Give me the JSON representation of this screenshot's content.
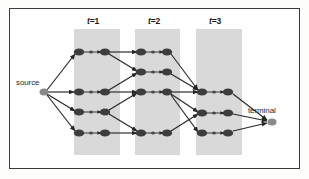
{
  "figure": {
    "type": "trellis-diagram",
    "title": "",
    "background_color": "#fefefe",
    "frame_color": "#3a3a3a",
    "band_color": "#cccccc",
    "node_color": "#3d3d3d",
    "small_node_color": "#4a4a4a",
    "edge_color": "#262626",
    "source_node_color": "#8a8a8a",
    "terminal_node_color": "#8a8a8a"
  },
  "labels": {
    "source": "source",
    "terminal": "terminal",
    "stages": [
      {
        "id": "t1",
        "var": "t",
        "eq": "=1",
        "text": "t=1"
      },
      {
        "id": "t2",
        "var": "t",
        "eq": "=2",
        "text": "t=2"
      },
      {
        "id": "t3",
        "var": "t",
        "eq": "=3",
        "text": "t=3"
      }
    ]
  },
  "bands": [
    {
      "id": "band-t1",
      "x": 74,
      "y": 29,
      "width": 46,
      "height": 126
    },
    {
      "id": "band-t2",
      "x": 135,
      "y": 29,
      "width": 45,
      "height": 126
    },
    {
      "id": "band-t3",
      "x": 196,
      "y": 29,
      "width": 46,
      "height": 126
    }
  ],
  "nodes": {
    "source": {
      "x": 44,
      "y": 92,
      "rx": 4.5,
      "ry": 3.6
    },
    "terminal": {
      "x": 272,
      "y": 122,
      "rx": 4.5,
      "ry": 3.6
    },
    "stage_nodes": [
      {
        "id": "t1-a-in",
        "x": 79,
        "y": 52,
        "rx": 5.2,
        "ry": 3.6
      },
      {
        "id": "t1-a-mid",
        "x": 91,
        "y": 52,
        "rx": 2.0,
        "ry": 1.6
      },
      {
        "id": "t1-a-out",
        "x": 105,
        "y": 52,
        "rx": 5.2,
        "ry": 3.6
      },
      {
        "id": "t1-b-in",
        "x": 79,
        "y": 92,
        "rx": 5.2,
        "ry": 3.6
      },
      {
        "id": "t1-b-mid",
        "x": 91,
        "y": 92,
        "rx": 2.0,
        "ry": 1.6
      },
      {
        "id": "t1-b-out",
        "x": 105,
        "y": 92,
        "rx": 5.2,
        "ry": 3.6
      },
      {
        "id": "t1-c-in",
        "x": 79,
        "y": 112,
        "rx": 5.2,
        "ry": 3.6
      },
      {
        "id": "t1-c-mid",
        "x": 91,
        "y": 112,
        "rx": 2.0,
        "ry": 1.6
      },
      {
        "id": "t1-c-out",
        "x": 105,
        "y": 112,
        "rx": 5.2,
        "ry": 3.6
      },
      {
        "id": "t1-d-in",
        "x": 79,
        "y": 133,
        "rx": 5.2,
        "ry": 3.6
      },
      {
        "id": "t1-d-mid",
        "x": 91,
        "y": 133,
        "rx": 2.0,
        "ry": 1.6
      },
      {
        "id": "t1-d-out",
        "x": 105,
        "y": 133,
        "rx": 5.2,
        "ry": 3.6
      },
      {
        "id": "t2-a-in",
        "x": 141,
        "y": 52,
        "rx": 5.2,
        "ry": 3.6
      },
      {
        "id": "t2-a-mid",
        "x": 153,
        "y": 52,
        "rx": 2.0,
        "ry": 1.6
      },
      {
        "id": "t2-a-out",
        "x": 167,
        "y": 52,
        "rx": 5.2,
        "ry": 3.6
      },
      {
        "id": "t2-b-in",
        "x": 141,
        "y": 72,
        "rx": 5.2,
        "ry": 3.6
      },
      {
        "id": "t2-b-mid",
        "x": 153,
        "y": 72,
        "rx": 2.0,
        "ry": 1.6
      },
      {
        "id": "t2-b-out",
        "x": 167,
        "y": 72,
        "rx": 5.2,
        "ry": 3.6
      },
      {
        "id": "t2-c-in",
        "x": 141,
        "y": 92,
        "rx": 5.2,
        "ry": 3.6
      },
      {
        "id": "t2-c-mid",
        "x": 153,
        "y": 92,
        "rx": 2.0,
        "ry": 1.6
      },
      {
        "id": "t2-c-out",
        "x": 167,
        "y": 92,
        "rx": 5.2,
        "ry": 3.6
      },
      {
        "id": "t2-d-in",
        "x": 141,
        "y": 133,
        "rx": 5.2,
        "ry": 3.6
      },
      {
        "id": "t2-d-mid",
        "x": 153,
        "y": 133,
        "rx": 2.0,
        "ry": 1.6
      },
      {
        "id": "t2-d-out",
        "x": 167,
        "y": 133,
        "rx": 5.2,
        "ry": 3.6
      },
      {
        "id": "t3-a-in",
        "x": 202,
        "y": 92,
        "rx": 5.2,
        "ry": 3.6
      },
      {
        "id": "t3-a-mid",
        "x": 214,
        "y": 92,
        "rx": 2.0,
        "ry": 1.6
      },
      {
        "id": "t3-a-out",
        "x": 228,
        "y": 92,
        "rx": 5.2,
        "ry": 3.6
      },
      {
        "id": "t3-b-in",
        "x": 202,
        "y": 113,
        "rx": 5.2,
        "ry": 3.6
      },
      {
        "id": "t3-b-mid",
        "x": 214,
        "y": 113,
        "rx": 2.0,
        "ry": 1.6
      },
      {
        "id": "t3-b-out",
        "x": 228,
        "y": 113,
        "rx": 5.2,
        "ry": 3.6
      },
      {
        "id": "t3-c-in",
        "x": 202,
        "y": 133,
        "rx": 5.2,
        "ry": 3.6
      },
      {
        "id": "t3-c-mid",
        "x": 214,
        "y": 133,
        "rx": 2.0,
        "ry": 1.6
      },
      {
        "id": "t3-c-out",
        "x": 228,
        "y": 133,
        "rx": 5.2,
        "ry": 3.6
      }
    ]
  },
  "edges": [
    {
      "id": "e-src-t1a",
      "x1": 47,
      "y1": 90,
      "x2": 75,
      "y2": 54
    },
    {
      "id": "e-src-t1b",
      "x1": 48,
      "y1": 92,
      "x2": 74,
      "y2": 92
    },
    {
      "id": "e-src-t1c",
      "x1": 47,
      "y1": 94,
      "x2": 75,
      "y2": 111
    },
    {
      "id": "e-src-t1d",
      "x1": 47,
      "y1": 95,
      "x2": 75,
      "y2": 131
    },
    {
      "id": "e-t1a-t2a",
      "x1": 110,
      "y1": 52,
      "x2": 137,
      "y2": 52
    },
    {
      "id": "e-t1a-t2b",
      "x1": 109,
      "y1": 54,
      "x2": 137,
      "y2": 71
    },
    {
      "id": "e-t1b-t2b",
      "x1": 109,
      "y1": 90,
      "x2": 137,
      "y2": 73
    },
    {
      "id": "e-t1b-t2c",
      "x1": 110,
      "y1": 92,
      "x2": 137,
      "y2": 92
    },
    {
      "id": "e-t1c-t2c",
      "x1": 109,
      "y1": 110,
      "x2": 137,
      "y2": 93
    },
    {
      "id": "e-t1c-t2d",
      "x1": 109,
      "y1": 114,
      "x2": 137,
      "y2": 131
    },
    {
      "id": "e-t1d-t2d",
      "x1": 110,
      "y1": 133,
      "x2": 137,
      "y2": 133
    },
    {
      "id": "e-t2a-t3a",
      "x1": 171,
      "y1": 54,
      "x2": 198,
      "y2": 90
    },
    {
      "id": "e-t2b-t3a",
      "x1": 171,
      "y1": 74,
      "x2": 198,
      "y2": 90
    },
    {
      "id": "e-t2c-t3a",
      "x1": 172,
      "y1": 92,
      "x2": 198,
      "y2": 92
    },
    {
      "id": "e-t2c-t3b",
      "x1": 171,
      "y1": 94,
      "x2": 198,
      "y2": 112
    },
    {
      "id": "e-t2c-t3c",
      "x1": 171,
      "y1": 95,
      "x2": 198,
      "y2": 132
    },
    {
      "id": "e-t2d-t3b",
      "x1": 171,
      "y1": 131,
      "x2": 198,
      "y2": 114
    },
    {
      "id": "e-t3a-term",
      "x1": 233,
      "y1": 94,
      "x2": 267,
      "y2": 120
    },
    {
      "id": "e-t3b-term",
      "x1": 233,
      "y1": 114,
      "x2": 267,
      "y2": 121
    },
    {
      "id": "e-t3c-term",
      "x1": 233,
      "y1": 131,
      "x2": 267,
      "y2": 123
    }
  ],
  "internal_arrows": [
    {
      "id": "ia-t1a",
      "x1": 84,
      "y1": 52,
      "x2": 101,
      "y2": 52
    },
    {
      "id": "ia-t1b",
      "x1": 84,
      "y1": 92,
      "x2": 101,
      "y2": 92
    },
    {
      "id": "ia-t1c",
      "x1": 84,
      "y1": 112,
      "x2": 101,
      "y2": 112
    },
    {
      "id": "ia-t1d",
      "x1": 84,
      "y1": 133,
      "x2": 101,
      "y2": 133
    },
    {
      "id": "ia-t2a",
      "x1": 146,
      "y1": 52,
      "x2": 163,
      "y2": 52
    },
    {
      "id": "ia-t2b",
      "x1": 146,
      "y1": 72,
      "x2": 163,
      "y2": 72
    },
    {
      "id": "ia-t2c",
      "x1": 146,
      "y1": 92,
      "x2": 163,
      "y2": 92
    },
    {
      "id": "ia-t2d",
      "x1": 146,
      "y1": 133,
      "x2": 163,
      "y2": 133
    },
    {
      "id": "ia-t3a",
      "x1": 207,
      "y1": 92,
      "x2": 224,
      "y2": 92
    },
    {
      "id": "ia-t3b",
      "x1": 207,
      "y1": 113,
      "x2": 224,
      "y2": 113
    },
    {
      "id": "ia-t3c",
      "x1": 207,
      "y1": 133,
      "x2": 224,
      "y2": 133
    }
  ],
  "label_positions": {
    "source": {
      "x": 16,
      "y": 78
    },
    "terminal": {
      "x": 248,
      "y": 106
    },
    "t1": {
      "x": 87,
      "y": 16
    },
    "t2": {
      "x": 148,
      "y": 16
    },
    "t3": {
      "x": 209,
      "y": 16
    }
  }
}
